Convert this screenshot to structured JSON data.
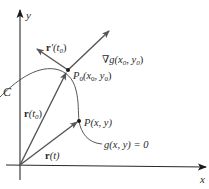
{
  "diagram": {
    "axes": {
      "x_label": "x",
      "y_label": "y"
    },
    "curve": {
      "name_label": "C",
      "equation_label": "g(x, y) = 0"
    },
    "points": {
      "p0_label": "P",
      "p0_sub": "0",
      "p0_coords": "(x",
      "p0_coords_sub": "0",
      "p0_coords_mid": ", y",
      "p0_coords_sub2": "0",
      "p0_coords_end": ")",
      "p_label": "P(x, y)"
    },
    "vectors": {
      "tangent_bold": "r",
      "tangent_rest": "′(t",
      "tangent_sub": "0",
      "tangent_end": ")",
      "gradient_nabla": "∇g(x",
      "gradient_sub": "0",
      "gradient_mid": ", y",
      "gradient_sub2": "0",
      "gradient_end": ")",
      "r_t0_bold": "r",
      "r_t0_rest": "(t",
      "r_t0_sub": "0",
      "r_t0_end": ")",
      "r_t_bold": "r",
      "r_t_rest": "(t)"
    },
    "colors": {
      "line": "#2a2a2a",
      "arrow": "#555555",
      "curve": "#444444"
    }
  }
}
